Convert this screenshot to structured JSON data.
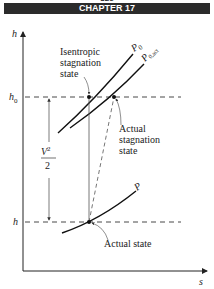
{
  "header": {
    "page_number": "826",
    "chapter": "CHAPTER 17"
  },
  "diagram": {
    "axes": {
      "y_label": "h",
      "x_label": "s"
    },
    "levels": {
      "h0": "h",
      "h0_sub": "0",
      "h": "h"
    },
    "curves": {
      "p0": {
        "label": "P",
        "sub": "0"
      },
      "p0act": {
        "label": "P",
        "sub": "0,act"
      },
      "p": {
        "label": "P"
      }
    },
    "annotations": {
      "isentropic": [
        "Isentropic",
        "stagnation",
        "state"
      ],
      "actual_stagnation": [
        "Actual",
        "stagnation",
        "state"
      ],
      "actual_state": "Actual state",
      "kinetic_num": "V",
      "kinetic_exp": "2",
      "kinetic_den": "2"
    }
  }
}
